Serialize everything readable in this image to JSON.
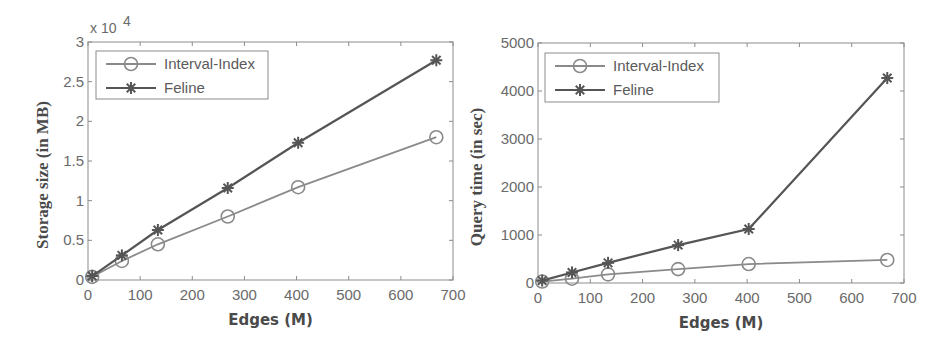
{
  "chart_data": [
    {
      "type": "line",
      "title": "",
      "xlabel": "Edges (M)",
      "ylabel": "Storage size (in MB)",
      "y_multiplier_label": "x 10",
      "y_multiplier_exp": "4",
      "xlim": [
        0,
        700
      ],
      "ylim": [
        0,
        3
      ],
      "xticks": [
        0,
        100,
        200,
        300,
        400,
        500,
        600,
        700
      ],
      "yticks": [
        0,
        0.5,
        1,
        1.5,
        2,
        2.5,
        3
      ],
      "ytick_labels": [
        "0",
        "0.5",
        "1",
        "1.5",
        "2",
        "2.5",
        "3"
      ],
      "legend_position": "top-left",
      "grid": false,
      "x": [
        8,
        65,
        134,
        268,
        403,
        668
      ],
      "series": [
        {
          "name": "Interval-Index",
          "marker": "circle",
          "color": "#8a8a8a",
          "values": [
            0.04,
            0.24,
            0.45,
            0.8,
            1.17,
            1.8
          ]
        },
        {
          "name": "Feline",
          "marker": "asterisk",
          "color": "#555555",
          "values": [
            0.05,
            0.31,
            0.63,
            1.16,
            1.73,
            2.77
          ]
        }
      ]
    },
    {
      "type": "line",
      "title": "",
      "xlabel": "Edges (M)",
      "ylabel": "Query time (in sec)",
      "xlim": [
        0,
        700
      ],
      "ylim": [
        0,
        5000
      ],
      "xticks": [
        0,
        100,
        200,
        300,
        400,
        500,
        600,
        700
      ],
      "yticks": [
        0,
        1000,
        2000,
        3000,
        4000,
        5000
      ],
      "ytick_labels": [
        "0",
        "1000",
        "2000",
        "3000",
        "4000",
        "5000"
      ],
      "legend_position": "top-left",
      "grid": false,
      "x": [
        8,
        65,
        134,
        268,
        403,
        668
      ],
      "series": [
        {
          "name": "Interval-Index",
          "marker": "circle",
          "color": "#8a8a8a",
          "values": [
            30,
            90,
            180,
            290,
            395,
            480
          ]
        },
        {
          "name": "Feline",
          "marker": "asterisk",
          "color": "#555555",
          "values": [
            50,
            220,
            420,
            790,
            1125,
            4270
          ]
        }
      ]
    }
  ]
}
